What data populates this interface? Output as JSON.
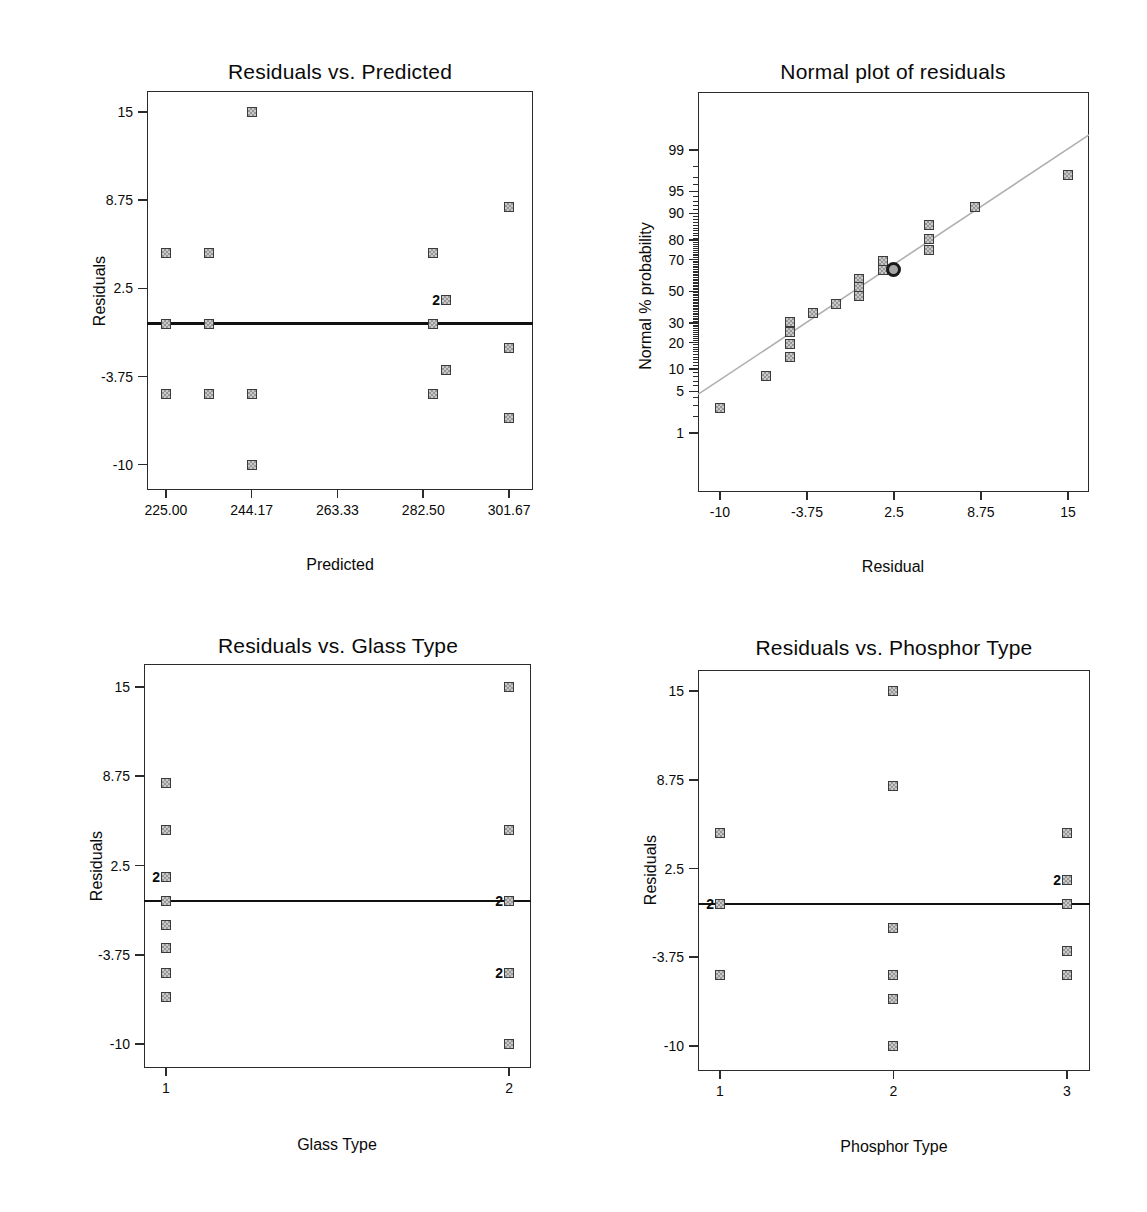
{
  "figure": {
    "description_titles": [
      "Residuals vs. Predicted",
      "Normal plot of residuals",
      "Residuals vs. Glass Type",
      "Residuals vs. Phosphor Type"
    ]
  },
  "style": {
    "background": "#ffffff",
    "text": "#0a0a0a",
    "axis": "#2b2b2b",
    "marker_border": "#3b3b3b",
    "marker_border_dark": "#1a1a1a",
    "marker_fill_light": "#c9c9c9",
    "marker_fill_dark": "#969696",
    "fit_line": "#b0b0b0",
    "mean_line": "#111111"
  },
  "chart_data": [
    {
      "id": "residuals-vs-predicted",
      "type": "scatter",
      "title": "Residuals vs. Predicted",
      "xlabel": "Predicted",
      "ylabel": "Residuals",
      "layout": {
        "plot": {
          "left": 147,
          "top": 91,
          "width": 386,
          "height": 399
        },
        "title": {
          "cx": 340,
          "y": 60
        },
        "ylabel": {
          "cx": 100,
          "cy": 291
        },
        "xlabel": {
          "cx": 340,
          "y": 556
        }
      },
      "xlim": [
        220.8,
        307.0
      ],
      "ylim": [
        -11.8,
        16.5
      ],
      "x_ticks": [
        {
          "v": 225.0,
          "label": "225.00"
        },
        {
          "v": 244.17,
          "label": "244.17"
        },
        {
          "v": 263.33,
          "label": "263.33"
        },
        {
          "v": 282.5,
          "label": "282.50"
        },
        {
          "v": 301.67,
          "label": "301.67"
        }
      ],
      "y_ticks": [
        {
          "v": 15,
          "label": "15"
        },
        {
          "v": 8.75,
          "label": "8.75"
        },
        {
          "v": 2.5,
          "label": "2.5"
        },
        {
          "v": -3.75,
          "label": "-3.75"
        },
        {
          "v": -10,
          "label": "-10"
        }
      ],
      "mean_line": 0,
      "points": [
        {
          "x": 244.17,
          "y": 15
        },
        {
          "x": 301.67,
          "y": 8.3
        },
        {
          "x": 225.0,
          "y": 5
        },
        {
          "x": 234.6,
          "y": 5
        },
        {
          "x": 284.7,
          "y": 5
        },
        {
          "x": 287.6,
          "y": 1.7,
          "label": "2"
        },
        {
          "x": 225.0,
          "y": 0
        },
        {
          "x": 234.6,
          "y": 0
        },
        {
          "x": 284.7,
          "y": 0
        },
        {
          "x": 301.67,
          "y": -1.7
        },
        {
          "x": 287.6,
          "y": -3.3
        },
        {
          "x": 225.0,
          "y": -5
        },
        {
          "x": 234.6,
          "y": -5
        },
        {
          "x": 244.17,
          "y": -5
        },
        {
          "x": 284.7,
          "y": -5
        },
        {
          "x": 301.67,
          "y": -6.7
        },
        {
          "x": 244.17,
          "y": -10
        }
      ]
    },
    {
      "id": "normal-plot-of-residuals",
      "type": "scatter",
      "yscale": "probit",
      "title": "Normal plot of residuals",
      "xlabel": "Residual",
      "ylabel": "Normal % probability",
      "layout": {
        "plot": {
          "left": 698,
          "top": 92,
          "width": 391,
          "height": 400
        },
        "title": {
          "cx": 893,
          "y": 60
        },
        "ylabel": {
          "cx": 646,
          "cy": 296
        },
        "xlabel": {
          "cx": 893,
          "y": 558
        }
      },
      "xlim": [
        -11.58,
        16.51
      ],
      "zlim": [
        -3.3,
        3.28
      ],
      "x_ticks": [
        {
          "v": -10,
          "label": "-10"
        },
        {
          "v": -3.75,
          "label": "-3.75"
        },
        {
          "v": 2.5,
          "label": "2.5"
        },
        {
          "v": 8.75,
          "label": "8.75"
        },
        {
          "v": 15,
          "label": "15"
        }
      ],
      "y_ticks": [
        {
          "v": 99,
          "label": "99"
        },
        {
          "v": 95,
          "label": "95"
        },
        {
          "v": 90,
          "label": "90"
        },
        {
          "v": 80,
          "label": "80"
        },
        {
          "v": 70,
          "label": "70"
        },
        {
          "v": 50,
          "label": "50"
        },
        {
          "v": 30,
          "label": "30"
        },
        {
          "v": 20,
          "label": "20"
        },
        {
          "v": 10,
          "label": "10"
        },
        {
          "v": 5,
          "label": "5"
        },
        {
          "v": 1,
          "label": "1"
        }
      ],
      "y_minor_ticks": {
        "from": 1,
        "to": 99,
        "step": 1
      },
      "fit_line": {
        "x1": -11.58,
        "p1": 4.5,
        "x2": 16.51,
        "p2": 99.5
      },
      "circle_point": {
        "x": 2.5,
        "p": 64
      },
      "points": [
        {
          "x": 15,
          "p": 97.2
        },
        {
          "x": 8.3,
          "p": 91.7
        },
        {
          "x": 5,
          "p": 86.1
        },
        {
          "x": 5,
          "p": 80.6
        },
        {
          "x": 5,
          "p": 75
        },
        {
          "x": 1.7,
          "p": 69.4
        },
        {
          "x": 1.7,
          "p": 63.9
        },
        {
          "x": 0,
          "p": 58.3
        },
        {
          "x": 0,
          "p": 52.8
        },
        {
          "x": 0,
          "p": 47.2
        },
        {
          "x": -1.7,
          "p": 41.7
        },
        {
          "x": -3.3,
          "p": 36.1
        },
        {
          "x": -5,
          "p": 30.6
        },
        {
          "x": -5,
          "p": 25
        },
        {
          "x": -5,
          "p": 19.4
        },
        {
          "x": -5,
          "p": 13.9
        },
        {
          "x": -6.7,
          "p": 8.3
        },
        {
          "x": -10,
          "p": 2.8
        }
      ]
    },
    {
      "id": "residuals-vs-glass-type",
      "type": "scatter",
      "title": "Residuals vs. Glass Type",
      "xlabel": "Glass Type",
      "ylabel": "Residuals",
      "layout": {
        "plot": {
          "left": 144,
          "top": 664,
          "width": 387,
          "height": 404
        },
        "title": {
          "cx": 338,
          "y": 634
        },
        "ylabel": {
          "cx": 97,
          "cy": 866
        },
        "xlabel": {
          "cx": 337,
          "y": 1136
        }
      },
      "xlim": [
        0.936,
        2.064
      ],
      "ylim": [
        -11.68,
        16.61
      ],
      "x_ticks": [
        {
          "v": 1,
          "label": "1"
        },
        {
          "v": 2,
          "label": "2"
        }
      ],
      "y_ticks": [
        {
          "v": 15,
          "label": "15"
        },
        {
          "v": 8.75,
          "label": "8.75"
        },
        {
          "v": 2.5,
          "label": "2.5"
        },
        {
          "v": -3.75,
          "label": "-3.75"
        },
        {
          "v": -10,
          "label": "-10"
        }
      ],
      "mean_line": 0,
      "points": [
        {
          "x": 1,
          "y": 8.3
        },
        {
          "x": 1,
          "y": 5
        },
        {
          "x": 1,
          "y": 1.7,
          "label": "2"
        },
        {
          "x": 1,
          "y": 0
        },
        {
          "x": 1,
          "y": -1.7
        },
        {
          "x": 1,
          "y": -3.3
        },
        {
          "x": 1,
          "y": -5
        },
        {
          "x": 1,
          "y": -6.7
        },
        {
          "x": 2,
          "y": 15
        },
        {
          "x": 2,
          "y": 5
        },
        {
          "x": 2,
          "y": 0,
          "label": "2"
        },
        {
          "x": 2,
          "y": -5,
          "label": "2"
        },
        {
          "x": 2,
          "y": -10
        }
      ]
    },
    {
      "id": "residuals-vs-phosphor-type",
      "type": "scatter",
      "title": "Residuals vs. Phosphor Type",
      "xlabel": "Phosphor Type",
      "ylabel": "Residuals",
      "layout": {
        "plot": {
          "left": 698,
          "top": 670,
          "width": 392,
          "height": 401
        },
        "title": {
          "cx": 894,
          "y": 636
        },
        "ylabel": {
          "cx": 651,
          "cy": 870
        },
        "xlabel": {
          "cx": 894,
          "y": 1138
        }
      },
      "xlim": [
        0.873,
        3.133
      ],
      "ylim": [
        -11.76,
        16.48
      ],
      "x_ticks": [
        {
          "v": 1,
          "label": "1"
        },
        {
          "v": 2,
          "label": "2"
        },
        {
          "v": 3,
          "label": "3"
        }
      ],
      "y_ticks": [
        {
          "v": 15,
          "label": "15"
        },
        {
          "v": 8.75,
          "label": "8.75"
        },
        {
          "v": 2.5,
          "label": "2.5"
        },
        {
          "v": -3.75,
          "label": "-3.75"
        },
        {
          "v": -10,
          "label": "-10"
        }
      ],
      "mean_line": 0,
      "points": [
        {
          "x": 1,
          "y": 5
        },
        {
          "x": 1,
          "y": 0,
          "label": "2"
        },
        {
          "x": 1,
          "y": -5
        },
        {
          "x": 2,
          "y": 15
        },
        {
          "x": 2,
          "y": 8.3
        },
        {
          "x": 2,
          "y": -1.7
        },
        {
          "x": 2,
          "y": -5
        },
        {
          "x": 2,
          "y": -6.7
        },
        {
          "x": 2,
          "y": -10
        },
        {
          "x": 3,
          "y": 5
        },
        {
          "x": 3,
          "y": 1.7,
          "label": "2"
        },
        {
          "x": 3,
          "y": 0
        },
        {
          "x": 3,
          "y": -3.3
        },
        {
          "x": 3,
          "y": -5
        }
      ]
    }
  ]
}
